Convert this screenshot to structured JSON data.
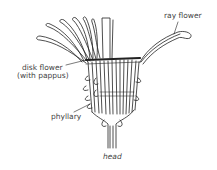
{
  "diagram": {
    "caption": "head",
    "labels": {
      "ray_flower": "ray flower",
      "disk_flower_line1": "disk flower",
      "disk_flower_line2": "(with pappus)",
      "phyllary": "phyllary"
    }
  }
}
